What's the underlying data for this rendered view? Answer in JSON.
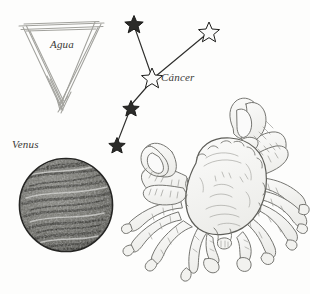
{
  "plate": {
    "title": "Lamina astrologica - Cancer",
    "background_color": "#fdfdfc",
    "ink_color": "#555551",
    "label_color": "#3a3a38"
  },
  "element_symbol": {
    "name": "Agua",
    "label": "Agua",
    "glyph": "downward-triangle",
    "meaning": "water-element",
    "stroke_color": "#9a9a96",
    "vertices": [
      [
        22,
        27
      ],
      [
        101,
        24
      ],
      [
        62,
        107
      ]
    ]
  },
  "constellation": {
    "label": "Cáncer",
    "name": "Cáncer",
    "star_count": 5,
    "line_color": "#2e2e2c",
    "star_fill": "#ffffff",
    "star_stroke": "#1c1c1a",
    "stars": [
      {
        "id": "star-1",
        "x": 134,
        "y": 24,
        "size": 8.5,
        "filled": true
      },
      {
        "id": "star-2",
        "x": 209,
        "y": 32,
        "size": 9.5,
        "filled": false
      },
      {
        "id": "star-3",
        "x": 152,
        "y": 78,
        "size": 9.5,
        "filled": false
      },
      {
        "id": "star-4",
        "x": 131,
        "y": 108,
        "size": 7.5,
        "filled": true
      },
      {
        "id": "star-5",
        "x": 117,
        "y": 145,
        "size": 7.5,
        "filled": true
      }
    ],
    "links": [
      [
        0,
        2
      ],
      [
        1,
        2
      ],
      [
        2,
        3
      ],
      [
        3,
        4
      ]
    ]
  },
  "planet": {
    "label": "Venus",
    "name": "Venus",
    "center_x": 66,
    "center_y": 205,
    "radius": 47,
    "outline_color": "#2b2b29",
    "surface_tone": "#6f6f6a",
    "texture": "stippled-banded"
  },
  "creature": {
    "name": "crab",
    "style": "engraving",
    "ink_color": "#6b6b66",
    "bounds": {
      "x": 130,
      "y": 108,
      "width": 180,
      "height": 178
    }
  }
}
